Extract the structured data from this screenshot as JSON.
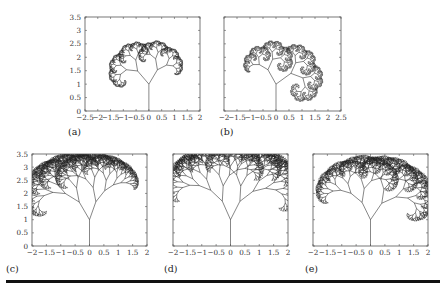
{
  "chart_data": [
    {
      "id": "a",
      "type": "line",
      "panel_label": "(a)",
      "description": "Asymmetric binary fractal tree (Pythagoras-like), canopy curling left",
      "xlim": [
        -2.5,
        2
      ],
      "ylim": [
        0,
        3.5
      ],
      "xticks": [
        -2.5,
        -2,
        -1.5,
        -1,
        -0.5,
        0,
        0.5,
        1,
        1.5,
        2
      ],
      "xtick_labels": [
        "−2.5",
        "−2",
        "−1.5",
        "−1",
        "−0.5",
        "0",
        "0.5",
        "1",
        "1.5",
        "2"
      ],
      "yticks": [
        0,
        0.5,
        1,
        1.5,
        2,
        2.5,
        3,
        3.5
      ],
      "ytick_labels": [
        "0",
        "0.5",
        "1",
        "1.5",
        "2",
        "2.5",
        "3",
        "3.5"
      ],
      "show_yticklabels": true,
      "tree": {
        "trunk": [
          [
            0,
            0
          ],
          [
            0,
            1
          ]
        ],
        "angle_left_deg": 42,
        "angle_right_deg": 32,
        "ratio_left": 0.66,
        "ratio_right": 0.63,
        "depth": 11
      }
    },
    {
      "id": "b",
      "type": "line",
      "panel_label": "(b)",
      "description": "Asymmetric binary fractal tree, canopy curling right",
      "xlim": [
        -2,
        2.5
      ],
      "ylim": [
        0,
        3.5
      ],
      "xticks": [
        -2,
        -1.5,
        -1,
        -0.5,
        0,
        0.5,
        1,
        1.5,
        2,
        2.5
      ],
      "xtick_labels": [
        "−2",
        "−1.5",
        "−1",
        "−0.5",
        "0",
        "0.5",
        "1",
        "1.5",
        "2",
        "2.5"
      ],
      "yticks": [
        0,
        0.5,
        1,
        1.5,
        2,
        2.5,
        3,
        3.5
      ],
      "ytick_labels": [
        "0",
        "0.5",
        "1",
        "1.5",
        "2",
        "2.5",
        "3",
        "3.5"
      ],
      "show_yticklabels": false,
      "tree": {
        "trunk": [
          [
            0,
            0
          ],
          [
            0,
            1
          ]
        ],
        "angle_left_deg": 30,
        "angle_right_deg": 55,
        "ratio_left": 0.62,
        "ratio_right": 0.7,
        "depth": 11
      }
    },
    {
      "id": "c",
      "type": "line",
      "panel_label": "(c)",
      "description": "Binary fractal tree with wider canopy, curling left",
      "xlim": [
        -2,
        2
      ],
      "ylim": [
        0,
        3.5
      ],
      "xticks": [
        -2,
        -1.5,
        -1,
        -0.5,
        0,
        0.5,
        1,
        1.5,
        2
      ],
      "xtick_labels": [
        "−2",
        "−1.5",
        "−1",
        "−0.5",
        "0",
        "0.5",
        "1",
        "1.5",
        "2"
      ],
      "yticks": [
        0,
        0.5,
        1,
        1.5,
        2,
        2.5,
        3,
        3.5
      ],
      "ytick_labels": [
        "0",
        "0.5",
        "1",
        "1.5",
        "2",
        "2.5",
        "3",
        "3.5"
      ],
      "show_yticklabels": true,
      "tree": {
        "trunk": [
          [
            0,
            0
          ],
          [
            0,
            1
          ]
        ],
        "angle_left_deg": 28,
        "angle_right_deg": 18,
        "ratio_left": 0.76,
        "ratio_right": 0.72,
        "depth": 11
      }
    },
    {
      "id": "d",
      "type": "line",
      "panel_label": "(d)",
      "description": "Nearly symmetric binary fractal tree, dome canopy",
      "xlim": [
        -2,
        2
      ],
      "ylim": [
        0,
        3.5
      ],
      "xticks": [
        -2,
        -1.5,
        -1,
        -0.5,
        0,
        0.5,
        1,
        1.5,
        2
      ],
      "xtick_labels": [
        "−2",
        "−1.5",
        "−1",
        "−0.5",
        "0",
        "0.5",
        "1",
        "1.5",
        "2"
      ],
      "yticks": [
        0,
        0.5,
        1,
        1.5,
        2,
        2.5,
        3,
        3.5
      ],
      "ytick_labels": [
        "0",
        "0.5",
        "1",
        "1.5",
        "2",
        "2.5",
        "3",
        "3.5"
      ],
      "show_yticklabels": false,
      "tree": {
        "trunk": [
          [
            0,
            0
          ],
          [
            0,
            1
          ]
        ],
        "angle_left_deg": 22,
        "angle_right_deg": 25,
        "ratio_left": 0.76,
        "ratio_right": 0.77,
        "depth": 11
      }
    },
    {
      "id": "e",
      "type": "line",
      "panel_label": "(e)",
      "description": "Binary fractal tree, canopy curling right",
      "xlim": [
        -2,
        2
      ],
      "ylim": [
        0,
        3.5
      ],
      "xticks": [
        -2,
        -1.5,
        -1,
        -0.5,
        0,
        0.5,
        1,
        1.5,
        2
      ],
      "xtick_labels": [
        "−2",
        "−1.5",
        "−1",
        "−0.5",
        "0",
        "0.5",
        "1",
        "1.5",
        "2"
      ],
      "yticks": [
        0,
        0.5,
        1,
        1.5,
        2,
        2.5,
        3,
        3.5
      ],
      "ytick_labels": [
        "0",
        "0.5",
        "1",
        "1.5",
        "2",
        "2.5",
        "3",
        "3.5"
      ],
      "show_yticklabels": false,
      "tree": {
        "trunk": [
          [
            0,
            0
          ],
          [
            0,
            1
          ]
        ],
        "angle_left_deg": 24,
        "angle_right_deg": 32,
        "ratio_left": 0.72,
        "ratio_right": 0.74,
        "depth": 11
      }
    }
  ]
}
